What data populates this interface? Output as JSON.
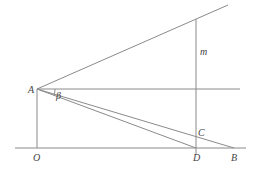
{
  "diagram": {
    "points": {
      "A": {
        "label": "A",
        "x": 37,
        "y": 89
      },
      "O": {
        "label": "O",
        "x": 37,
        "y": 148
      },
      "D": {
        "label": "D",
        "x": 196,
        "y": 148
      },
      "B": {
        "label": "B",
        "x": 234,
        "y": 148
      },
      "C": {
        "label": "C",
        "x": 196,
        "y": 134
      }
    },
    "labels": {
      "A": "A",
      "O": "O",
      "D": "D",
      "B": "B",
      "C": "C",
      "m": "m",
      "beta": "β"
    },
    "line_color": "#8a8a8a",
    "text_color": "#444444"
  }
}
